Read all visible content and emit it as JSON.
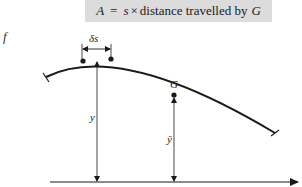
{
  "formula": {
    "lhs": "A",
    "equals": "=",
    "factor": "s",
    "times": "×",
    "rest": "distance travelled by",
    "centroid": "G"
  },
  "clipped_text": "f",
  "labels": {
    "arc_element": "δs",
    "y": "y",
    "centroid": "G",
    "y_bar": "ȳ"
  },
  "colors": {
    "formula_background": "#dcdcdc",
    "ink": "#1a1a1a"
  }
}
